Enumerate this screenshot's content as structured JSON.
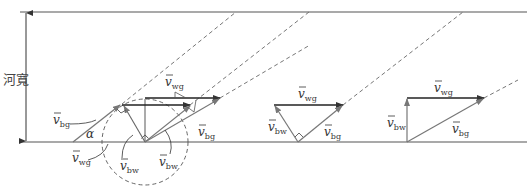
{
  "diagram": {
    "river_width_label": "河寬",
    "angle_label": "α",
    "vector_symbol": "v",
    "subscripts": {
      "bg": "bg",
      "wg": "wg",
      "bw": "bw"
    },
    "labels": {
      "left_bg": "bg",
      "left_wg": "wg",
      "left_bw": "bw",
      "left_bw2": "bw",
      "left_top_wg": "wg",
      "left_right_bg": "bg",
      "mid_wg": "wg",
      "mid_bw": "bw",
      "mid_bg": "bg",
      "right_wg": "wg",
      "right_bw": "bw",
      "right_bg": "bg"
    },
    "colors": {
      "line": "#555555",
      "arrow": "#333333",
      "dash": "#666666"
    }
  }
}
